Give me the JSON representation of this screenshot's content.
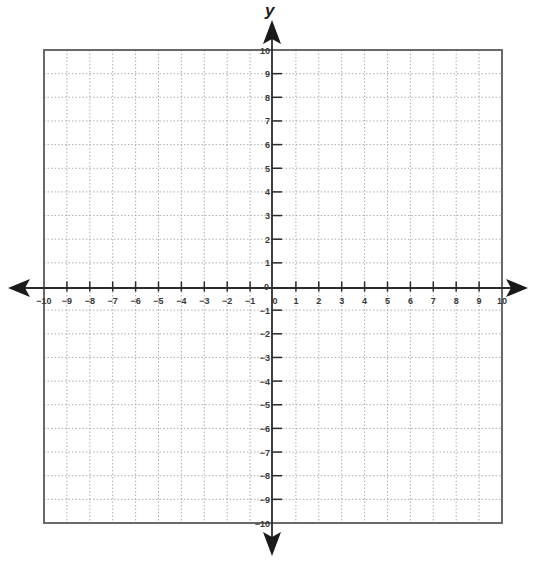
{
  "chart_data": {
    "type": "scatter",
    "title": "",
    "subtitle": "",
    "xlabel": "",
    "ylabel": "y",
    "xlim": [
      -10,
      10
    ],
    "ylim": [
      -10,
      10
    ],
    "grid": true,
    "grid_style": "dotted",
    "legend": null,
    "x_tick_labels": [
      "-10",
      "-9",
      "-8",
      "-7",
      "-6",
      "-5",
      "-4",
      "-3",
      "-2",
      "-1",
      "0",
      "1",
      "2",
      "3",
      "4",
      "5",
      "6",
      "7",
      "8",
      "9",
      "10"
    ],
    "y_tick_labels": [
      "10",
      "9",
      "8",
      "7",
      "6",
      "5",
      "4",
      "3",
      "2",
      "1",
      "0",
      "-1",
      "-2",
      "-3",
      "-4",
      "-5",
      "-6",
      "-7",
      "-8",
      "-9",
      "-10"
    ],
    "series": []
  },
  "axes": {
    "y_title": "y",
    "x_title": ""
  },
  "colors": {
    "axis": "#2b2b2b",
    "border": "#5a5a5a",
    "grid": "#9a9a9a",
    "label": "#3a3a3a"
  }
}
